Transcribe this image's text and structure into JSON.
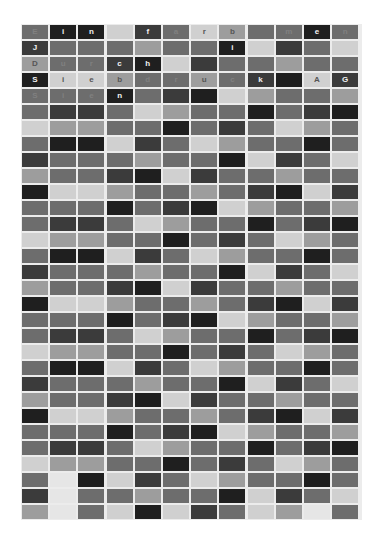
{
  "grid": {
    "columns": 12,
    "rows": 31,
    "shades": {
      "A": "#1f1f1f",
      "B": "#3b3b3b",
      "C": "#5e5e5e",
      "D": "#6d6d6d",
      "E": "#9d9d9d",
      "F": "#d0d0d0",
      "W": "#e6e6e6"
    },
    "pattern": [
      [
        "D",
        "A",
        "A",
        "F",
        "B",
        "D",
        "F",
        "E",
        "D",
        "D",
        "A",
        "D"
      ],
      [
        "B",
        "D",
        "D",
        "D",
        "E",
        "D",
        "D",
        "A",
        "F",
        "B",
        "D",
        "F"
      ],
      [
        "E",
        "D",
        "D",
        "B",
        "A",
        "F",
        "B",
        "D",
        "D",
        "E",
        "D",
        "D"
      ],
      [
        "A",
        "F",
        "F",
        "E",
        "D",
        "D",
        "E",
        "D",
        "B",
        "A",
        "F",
        "B"
      ],
      [
        "D",
        "D",
        "D",
        "A",
        "D",
        "B",
        "A",
        "F",
        "E",
        "D",
        "D",
        "E"
      ],
      [
        "D",
        "B",
        "B",
        "D",
        "F",
        "E",
        "D",
        "D",
        "A",
        "D",
        "B",
        "A"
      ],
      [
        "F",
        "E",
        "E",
        "D",
        "D",
        "A",
        "D",
        "B",
        "D",
        "F",
        "E",
        "D"
      ]
    ],
    "overrides": [
      {
        "row": 28,
        "col": 1,
        "shade": "W"
      },
      {
        "row": 29,
        "col": 1,
        "shade": "W"
      },
      {
        "row": 30,
        "col": 1,
        "shade": "W"
      },
      {
        "row": 30,
        "col": 3,
        "shade": "F"
      },
      {
        "row": 30,
        "col": 8,
        "shade": "F"
      },
      {
        "row": 30,
        "col": 10,
        "shade": "W"
      }
    ],
    "letters": [
      [
        "E",
        "i",
        "n",
        "",
        "f",
        "a",
        "r",
        "b",
        "",
        "m",
        "e",
        "n"
      ],
      [
        "J",
        "",
        "",
        "",
        "",
        "",
        "",
        "i",
        "",
        "",
        "",
        ""
      ],
      [
        "D",
        "u",
        "r",
        "c",
        "h",
        "",
        "",
        "",
        "",
        "",
        "",
        ""
      ],
      [
        "S",
        "i",
        "e",
        "b",
        "d",
        "r",
        "u",
        "c",
        "k",
        "",
        "A",
        "G"
      ],
      [
        "S",
        "i",
        "e",
        "n",
        "",
        "",
        "",
        "",
        "",
        "",
        "",
        ""
      ]
    ],
    "letter_colors": {
      "on_dark": "#f2f2f2",
      "on_light": "#555555",
      "faint": "#808080"
    }
  }
}
